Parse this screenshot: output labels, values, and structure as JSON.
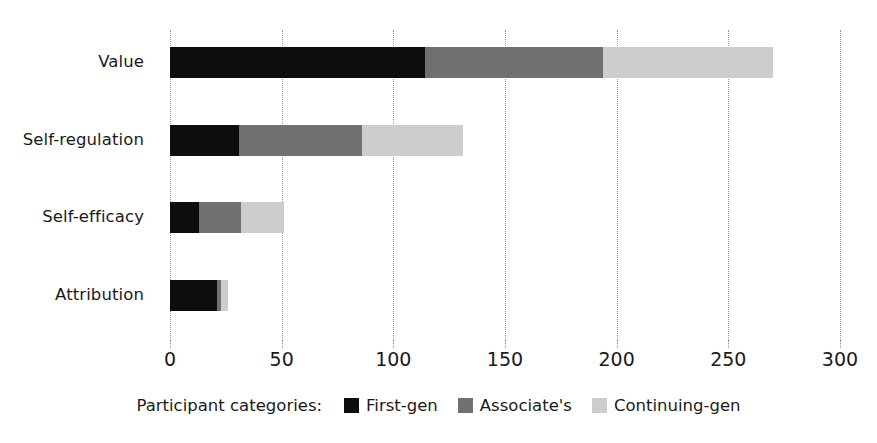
{
  "chart_data": {
    "type": "bar",
    "orientation": "horizontal",
    "stacked": true,
    "title": "",
    "xlabel": "",
    "ylabel": "",
    "categories": [
      "Attribution",
      "Self-efficacy",
      "Self-regulation",
      "Value"
    ],
    "categories_top_to_bottom": [
      "Value",
      "Self-regulation",
      "Self-efficacy",
      "Attribution"
    ],
    "series": [
      {
        "name": "First-gen",
        "color": "#0d0d0d",
        "values": [
          114,
          31,
          13,
          21
        ]
      },
      {
        "name": "Associate's",
        "color": "#707070",
        "values": [
          80,
          55,
          19,
          2
        ]
      },
      {
        "name": "Continuing-gen",
        "color": "#cdcdcd",
        "values": [
          76,
          45,
          19,
          3
        ]
      }
    ],
    "series_order_note": "values arrays are ordered top-to-bottom: Value, Self-regulation, Self-efficacy, Attribution",
    "totals": [
      270,
      131,
      51,
      26
    ],
    "xlim": [
      0,
      300
    ],
    "xticks": [
      0,
      50,
      100,
      150,
      200,
      250,
      300
    ],
    "xtick_labels": [
      "0",
      "50",
      "100",
      "150",
      "200",
      "250",
      "300"
    ],
    "grid": "vertical-dotted",
    "legend_position": "bottom-center"
  },
  "axis": {
    "x_ticks": [
      {
        "value": 0,
        "label": "0"
      },
      {
        "value": 50,
        "label": "50"
      },
      {
        "value": 100,
        "label": "100"
      },
      {
        "value": 150,
        "label": "150"
      },
      {
        "value": 200,
        "label": "200"
      },
      {
        "value": 250,
        "label": "250"
      },
      {
        "value": 300,
        "label": "300"
      }
    ],
    "y_categories": [
      {
        "label": "Value"
      },
      {
        "label": "Self-regulation"
      },
      {
        "label": "Self-efficacy"
      },
      {
        "label": "Attribution"
      }
    ]
  },
  "bars": [
    {
      "category": "Value",
      "segments": [
        {
          "series": "First-gen",
          "value": 114,
          "start": 0,
          "end": 114
        },
        {
          "series": "Associate's",
          "value": 80,
          "start": 114,
          "end": 194
        },
        {
          "series": "Continuing-gen",
          "value": 76,
          "start": 194,
          "end": 270
        }
      ]
    },
    {
      "category": "Self-regulation",
      "segments": [
        {
          "series": "First-gen",
          "value": 31,
          "start": 0,
          "end": 31
        },
        {
          "series": "Associate's",
          "value": 55,
          "start": 31,
          "end": 86
        },
        {
          "series": "Continuing-gen",
          "value": 45,
          "start": 86,
          "end": 131
        }
      ]
    },
    {
      "category": "Self-efficacy",
      "segments": [
        {
          "series": "First-gen",
          "value": 13,
          "start": 0,
          "end": 13
        },
        {
          "series": "Associate's",
          "value": 19,
          "start": 13,
          "end": 32
        },
        {
          "series": "Continuing-gen",
          "value": 19,
          "start": 32,
          "end": 51
        }
      ]
    },
    {
      "category": "Attribution",
      "segments": [
        {
          "series": "First-gen",
          "value": 21,
          "start": 0,
          "end": 21
        },
        {
          "series": "Associate's",
          "value": 2,
          "start": 21,
          "end": 23
        },
        {
          "series": "Continuing-gen",
          "value": 3,
          "start": 23,
          "end": 26
        }
      ]
    }
  ],
  "legend": {
    "title": "Participant categories:",
    "items": [
      {
        "label": "First-gen",
        "color": "#0d0d0d"
      },
      {
        "label": "Associate's",
        "color": "#707070"
      },
      {
        "label": "Continuing-gen",
        "color": "#cdcdcd"
      }
    ]
  },
  "colors": {
    "first_gen": "#0d0d0d",
    "associates": "#707070",
    "continuing_gen": "#cdcdcd",
    "gridline": "#9a9a9a",
    "text": "#1a1a1a",
    "background": "#ffffff"
  }
}
